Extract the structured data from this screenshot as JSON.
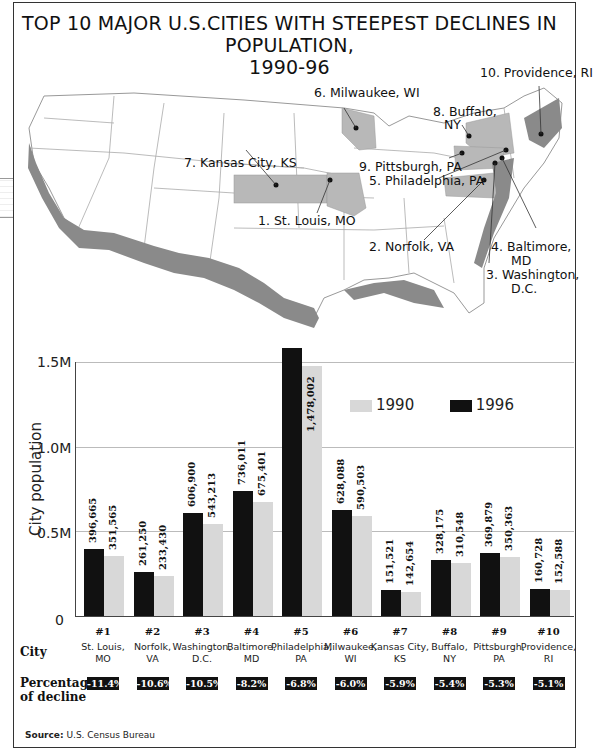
{
  "title": {
    "line1": "TOP 10 MAJOR U.S.CITIES WITH STEEPEST DECLINES IN POPULATION,",
    "line2": "1990-96"
  },
  "map": {
    "labels": [
      {
        "id": "providence",
        "text": "10. Providence, RI"
      },
      {
        "id": "milwaukee",
        "text": "6. Milwaukee, WI"
      },
      {
        "id": "buffalo_1",
        "text": "8. Buffalo,"
      },
      {
        "id": "buffalo_2",
        "text": "NY"
      },
      {
        "id": "kansas",
        "text": "7. Kansas City, KS"
      },
      {
        "id": "pittsburgh",
        "text": "9. Pittsburgh, PA"
      },
      {
        "id": "philadelphia",
        "text": "5. Philadelphia, PA"
      },
      {
        "id": "stlouis",
        "text": "1. St. Louis, MO"
      },
      {
        "id": "norfolk",
        "text": "2. Norfolk, VA"
      },
      {
        "id": "baltimore_1",
        "text": "4. Baltimore,"
      },
      {
        "id": "baltimore_2",
        "text": "MD"
      },
      {
        "id": "washington_1",
        "text": "3. Washington,"
      },
      {
        "id": "washington_2",
        "text": "D.C."
      }
    ],
    "colors": {
      "highlight": "#b8b8b8",
      "coast": "#888888",
      "border": "#999999"
    }
  },
  "chart_data": {
    "type": "bar",
    "title": "TOP 10 MAJOR U.S.CITIES WITH STEEPEST DECLINES IN POPULATION, 1990-96",
    "xlabel": "City",
    "ylabel": "City population",
    "ylim": [
      0,
      1500000
    ],
    "yticks": [
      "0",
      "0.5M",
      "1.0M",
      "1.5M"
    ],
    "grid": true,
    "legend_position": "upper right inside plot",
    "ranks": [
      "#1",
      "#2",
      "#3",
      "#4",
      "#5",
      "#6",
      "#7",
      "#8",
      "#9",
      "#10"
    ],
    "categories": [
      "St. Louis, MO",
      "Norfolk, VA",
      "Washington, D.C.",
      "Baltimore, MD",
      "Philadelphia, PA",
      "Milwaukee, WI",
      "Kansas City, KS",
      "Buffalo, NY",
      "Pittsburgh, PA",
      "Providence, RI"
    ],
    "series": [
      {
        "name": "1996",
        "color": "#111111",
        "values": [
          396665,
          261250,
          606900,
          736011,
          1585577,
          628088,
          151521,
          328175,
          369879,
          160728
        ],
        "labels": [
          "396,665",
          "261,250",
          "606,900",
          "736,011",
          "1,585,577",
          "628,088",
          "151,521",
          "328,175",
          "369,879",
          "160,728"
        ]
      },
      {
        "name": "1990",
        "color": "#d8d8d8",
        "values": [
          351565,
          233430,
          543213,
          675401,
          1478002,
          590503,
          142654,
          310548,
          350363,
          152588
        ],
        "labels": [
          "351,565",
          "233,430",
          "543,213",
          "675,401",
          "1,478,002",
          "590,503",
          "142,654",
          "310,548",
          "350,363",
          "152,588"
        ]
      }
    ],
    "percentage_of_decline": [
      "-11.4%",
      "-10.6%",
      "-10.5%",
      "-8.2%",
      "-6.8%",
      "-6.0%",
      "-5.9%",
      "-5.4%",
      "-5.3%",
      "-5.1%"
    ]
  },
  "axis": {
    "y_title": "City population",
    "ticks": {
      "t0": "0",
      "t05": "0.5M",
      "t10": "1.0M",
      "t15": "1.5M"
    }
  },
  "legend": {
    "light": "1990",
    "dark": "1996"
  },
  "rows": {
    "city": "City",
    "pct_1": "Percentage",
    "pct_2": "of decline"
  },
  "cities": [
    {
      "rank": "#1",
      "l1": "St. Louis,",
      "l2": "MO",
      "pct": "-11.4%"
    },
    {
      "rank": "#2",
      "l1": "Norfolk,",
      "l2": "VA",
      "pct": "-10.6%"
    },
    {
      "rank": "#3",
      "l1": "Washington,",
      "l2": "D.C.",
      "pct": "-10.5%"
    },
    {
      "rank": "#4",
      "l1": "Baltimore,",
      "l2": "MD",
      "pct": "-8.2%"
    },
    {
      "rank": "#5",
      "l1": "Philadelphia,",
      "l2": "PA",
      "pct": "-6.8%"
    },
    {
      "rank": "#6",
      "l1": "Milwaukee,",
      "l2": "WI",
      "pct": "-6.0%"
    },
    {
      "rank": "#7",
      "l1": "Kansas City,",
      "l2": "KS",
      "pct": "-5.9%"
    },
    {
      "rank": "#8",
      "l1": "Buffalo,",
      "l2": "NY",
      "pct": "-5.4%"
    },
    {
      "rank": "#9",
      "l1": "Pittsburgh,",
      "l2": "PA",
      "pct": "-5.3%"
    },
    {
      "rank": "#10",
      "l1": "Providence,",
      "l2": "RI",
      "pct": "-5.1%"
    }
  ],
  "source": {
    "label": "Source:",
    "text": "U.S. Census Bureau"
  }
}
